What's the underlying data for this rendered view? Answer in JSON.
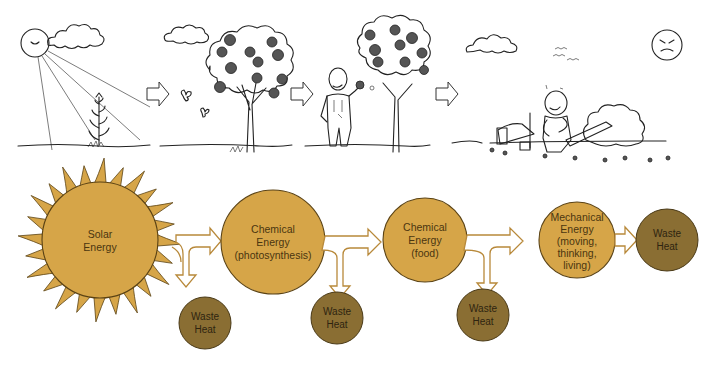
{
  "diagram": {
    "colors": {
      "energy_fill": "#D6A548",
      "energy_stroke": "#5a4214",
      "waste_fill": "#8A6E33",
      "waste_stroke": "#4a3a18",
      "arrow_stroke": "#B8893A",
      "sketch_ink": "#222222"
    },
    "illustrations": [
      {
        "id": "sun-plant",
        "description": "Sun with rays shining on a young plant"
      },
      {
        "id": "apple-tree",
        "description": "Apple tree with fruit and butterflies"
      },
      {
        "id": "man-eating-apple",
        "description": "Man in overalls eating an apple beside a tree"
      },
      {
        "id": "man-resting",
        "description": "Tired man sitting near a chopped tree with an axe and angry sun"
      }
    ],
    "nodes": [
      {
        "id": "solar",
        "lines": [
          "Solar",
          "Energy"
        ],
        "type": "energy"
      },
      {
        "id": "photosynthesis",
        "lines": [
          "Chemical",
          "Energy",
          "(photosynthesis)"
        ],
        "type": "energy"
      },
      {
        "id": "food",
        "lines": [
          "Chemical",
          "Energy",
          "(food)"
        ],
        "type": "energy"
      },
      {
        "id": "mechanical",
        "lines": [
          "Mechanical",
          "Energy",
          "(moving,",
          "thinking,",
          "living)"
        ],
        "type": "energy"
      },
      {
        "id": "waste1",
        "lines": [
          "Waste",
          "Heat"
        ],
        "type": "waste"
      },
      {
        "id": "waste2",
        "lines": [
          "Waste",
          "Heat"
        ],
        "type": "waste"
      },
      {
        "id": "waste3",
        "lines": [
          "Waste",
          "Heat"
        ],
        "type": "waste"
      },
      {
        "id": "waste4",
        "lines": [
          "Waste",
          "Heat"
        ],
        "type": "waste"
      }
    ],
    "edges": [
      {
        "from": "solar",
        "to": "photosynthesis"
      },
      {
        "from": "solar",
        "to": "waste1"
      },
      {
        "from": "photosynthesis",
        "to": "food"
      },
      {
        "from": "photosynthesis",
        "to": "waste2"
      },
      {
        "from": "food",
        "to": "mechanical"
      },
      {
        "from": "food",
        "to": "waste3"
      },
      {
        "from": "mechanical",
        "to": "waste4"
      }
    ]
  }
}
